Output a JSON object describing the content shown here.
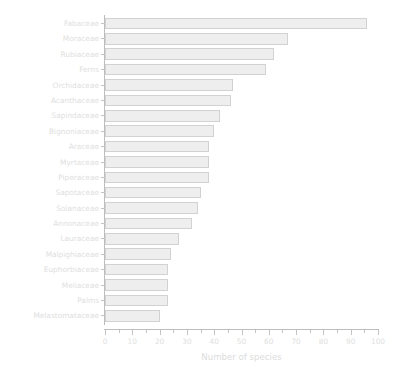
{
  "chart_data": {
    "type": "bar",
    "orientation": "horizontal",
    "title": "",
    "xlabel": "Number of species",
    "ylabel": "",
    "xlim": [
      0,
      100
    ],
    "ylim": null,
    "grid": false,
    "legend": null,
    "xticks": [
      0,
      10,
      20,
      30,
      40,
      50,
      60,
      70,
      80,
      90,
      100
    ],
    "xtick_labels": [
      "0",
      "10",
      "20",
      "30",
      "40",
      "50",
      "60",
      "70",
      "80",
      "90",
      "100"
    ],
    "minor_tick_interval": 5,
    "bar_fill_color": "#eeeeee",
    "bar_edge_color": "#d2d2d2",
    "axis_color": "#bdbdbd",
    "text_color": "#e0e0e0",
    "categories": [
      "Fabaceae",
      "Moraceae",
      "Rubiaceae",
      "Ferns",
      "Orchidaceae",
      "Acanthaceae",
      "Sapindaceae",
      "Bignoniaceae",
      "Araceae",
      "Myrtaceae",
      "Piperaceae",
      "Sapotaceae",
      "Solanaceae",
      "Annonaceae",
      "Lauraceae",
      "Malpighiaceae",
      "Euphorbiaceae",
      "Meliaceae",
      "Palms",
      "Melastomataceae"
    ],
    "values": [
      96,
      67,
      62,
      59,
      47,
      46,
      42,
      40,
      38,
      38,
      38,
      35,
      34,
      32,
      27,
      24,
      23,
      23,
      23,
      20
    ]
  }
}
